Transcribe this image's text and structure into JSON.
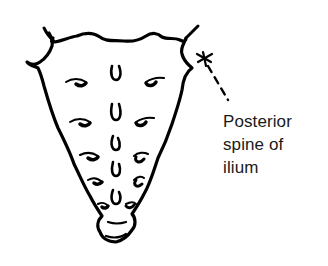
{
  "diagram": {
    "view": "posterior",
    "label": {
      "lines": [
        "Posterior",
        "spine of",
        "ilium"
      ]
    },
    "colors": {
      "line": "#000000",
      "text": "#1a1a1a",
      "background": "#ffffff"
    }
  }
}
